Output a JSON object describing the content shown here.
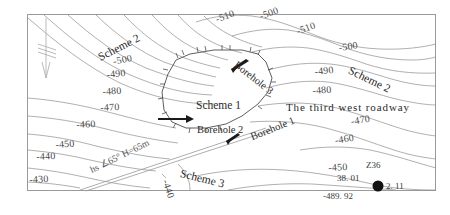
{
  "figure": {
    "type": "contour-map",
    "title": "",
    "frame_color": "#9a9a9a",
    "contour_color": "#8a8a8a",
    "text_color": "#333333",
    "background": "#ffffff"
  },
  "contour_labels": [
    {
      "text": "-510",
      "x": 214,
      "y": 14,
      "rot": -20
    },
    {
      "text": "-500",
      "x": 258,
      "y": 11,
      "rot": -20
    },
    {
      "text": "-510",
      "x": 295,
      "y": 26,
      "rot": -20
    },
    {
      "text": "-500",
      "x": 338,
      "y": 42,
      "rot": -8
    },
    {
      "text": "-500",
      "x": 112,
      "y": 56,
      "rot": -12
    },
    {
      "text": "-490",
      "x": 106,
      "y": 69,
      "rot": -6
    },
    {
      "text": "-490",
      "x": 314,
      "y": 66,
      "rot": -6
    },
    {
      "text": "-480",
      "x": 102,
      "y": 86,
      "rot": -4
    },
    {
      "text": "-480",
      "x": 312,
      "y": 85,
      "rot": -4
    },
    {
      "text": "-470",
      "x": 100,
      "y": 102,
      "rot": -3
    },
    {
      "text": "-470",
      "x": 350,
      "y": 116,
      "rot": -10
    },
    {
      "text": "-460",
      "x": 76,
      "y": 119,
      "rot": -3
    },
    {
      "text": "-460",
      "x": 334,
      "y": 135,
      "rot": -10
    },
    {
      "text": "-450",
      "x": 55,
      "y": 139,
      "rot": -4
    },
    {
      "text": "-450",
      "x": 328,
      "y": 162,
      "rot": -3
    },
    {
      "text": "-440",
      "x": 36,
      "y": 151,
      "rot": -3
    },
    {
      "text": "-430",
      "x": 29,
      "y": 174,
      "rot": -3
    },
    {
      "text": "-440",
      "x": 171,
      "y": 178,
      "rot": 72
    }
  ],
  "scheme_labels": [
    {
      "text": "Scheme 2",
      "x": 96,
      "y": 52,
      "rot": -27
    },
    {
      "text": "Scheme 2",
      "x": 352,
      "y": 64,
      "rot": 26
    },
    {
      "text": "Scheme 1",
      "x": 196,
      "y": 99,
      "rot": 0
    },
    {
      "text": "Scheme 3",
      "x": 182,
      "y": 167,
      "rot": 14
    }
  ],
  "borehole_labels": [
    {
      "text": "Borehole 3",
      "x": 239,
      "y": 59,
      "rot": 38
    },
    {
      "text": "Borehole 2",
      "x": 197,
      "y": 124,
      "rot": 0
    },
    {
      "text": "Borehole 1",
      "x": 249,
      "y": 132,
      "rot": -22
    }
  ],
  "roadway_label": {
    "text": "The third west roadway",
    "x": 286,
    "y": 101,
    "rot": 0
  },
  "fault_label": {
    "text": "hs ∠65° H=65m",
    "x": 88,
    "y": 165,
    "rot": -26
  },
  "borehole_marker": {
    "name": "Z36",
    "top_elevation": "38. 01",
    "bottom_elevation": "-489. 92",
    "thickness": "2. 11",
    "marker_x": 378,
    "marker_y": 186,
    "marker_color": "#111111"
  },
  "north_arrow": {
    "name": "north-arrow",
    "x": 46,
    "y": 18
  },
  "legend_hint": {
    "goaf_symbol": "hatched-panel-boundary"
  }
}
